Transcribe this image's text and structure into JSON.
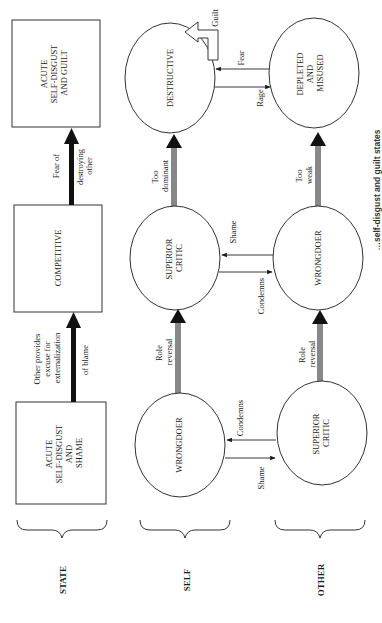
{
  "rows": {
    "state": "STATE",
    "self": "SELF",
    "other": "OTHER"
  },
  "states": [
    {
      "lines": [
        "ACUTE",
        "SELF-DISGUST",
        "AND",
        "SHAME"
      ]
    },
    {
      "lines": [
        "COMPETITIVE"
      ]
    },
    {
      "lines": [
        "ACUTE",
        "SELF-DISGUST",
        "AND GUILT"
      ]
    }
  ],
  "state_transitions": [
    {
      "lines": [
        "Other provides",
        "excuse for",
        "externalization",
        "of blame"
      ]
    },
    {
      "lines": [
        "Fear of",
        "destroying",
        "other"
      ]
    }
  ],
  "self_nodes": [
    {
      "lines": [
        "WRONGDOER"
      ]
    },
    {
      "lines": [
        "SUPERIOR",
        "CRITIC"
      ]
    },
    {
      "lines": [
        "DESTRUCTIVE"
      ]
    }
  ],
  "other_nodes": [
    {
      "lines": [
        "SUPERIOR",
        "CRITIC"
      ]
    },
    {
      "lines": [
        "WRONGDOER"
      ]
    },
    {
      "lines": [
        "DEPLETED",
        "AND",
        "MISUSED"
      ]
    }
  ],
  "self_transitions": [
    {
      "lines": [
        "Role",
        "reversal"
      ]
    },
    {
      "lines": [
        "Too",
        "dominant"
      ]
    }
  ],
  "other_transitions": [
    {
      "lines": [
        "Role",
        "reversal"
      ]
    },
    {
      "lines": [
        "Too",
        "weak"
      ]
    }
  ],
  "interactions": [
    {
      "to_self": "Condemns",
      "to_other": "Shame"
    },
    {
      "to_self": "Shame",
      "to_other": "Condemns"
    },
    {
      "to_self": "Fear",
      "to_other": "Rage"
    }
  ],
  "guilt_label": "Guilt",
  "caption": "…self-disgust and guilt states"
}
